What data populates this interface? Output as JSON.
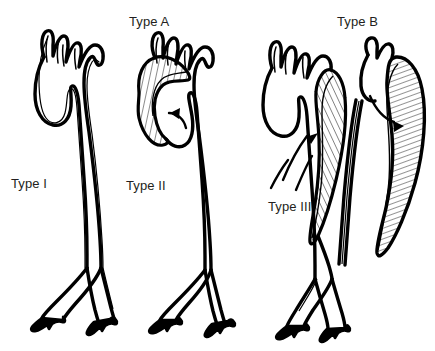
{
  "figure": {
    "title_visible": false,
    "background_color": "#ffffff",
    "ink_color": "#000000",
    "label_color": "#231f20"
  },
  "labels": {
    "stanford": [
      {
        "id": "type-a",
        "text": "Type A",
        "x": 129,
        "y": 14
      },
      {
        "id": "type-b",
        "text": "Type B",
        "x": 337,
        "y": 14
      }
    ],
    "debakey": [
      {
        "id": "type-1",
        "text": "Type I",
        "x": 11,
        "y": 176
      },
      {
        "id": "type-2",
        "text": "Type II",
        "x": 126,
        "y": 178
      },
      {
        "id": "type-3",
        "text": "Type III",
        "x": 268,
        "y": 199
      }
    ]
  },
  "specimens": [
    {
      "id": "aorta-type-1",
      "debakey_label": "Type I",
      "stanford_group": "Type A",
      "dissection_extent": "ascending-arch-descending",
      "has_hatched_false_lumen": false,
      "has_entry_arrow": false,
      "arch_branches": 3
    },
    {
      "id": "aorta-type-2",
      "debakey_label": "Type II",
      "stanford_group": "Type A",
      "dissection_extent": "ascending-only",
      "has_hatched_false_lumen": true,
      "has_entry_arrow": true,
      "arch_branches": 3
    },
    {
      "id": "aorta-type-3a",
      "debakey_label": "Type III",
      "stanford_group": "Type B",
      "dissection_extent": "descending-thoracic",
      "has_hatched_false_lumen": true,
      "has_entry_arrow": true,
      "arch_branches": 3
    },
    {
      "id": "aorta-type-3b",
      "debakey_label": "Type III",
      "stanford_group": "Type B",
      "dissection_extent": "descending-thoracoabdominal",
      "has_hatched_false_lumen": true,
      "has_entry_arrow": true,
      "arch_branches": 1
    }
  ]
}
